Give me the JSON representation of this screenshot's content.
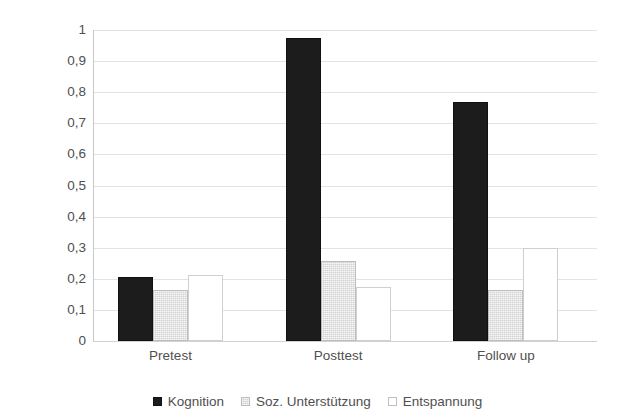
{
  "chart_data": {
    "type": "bar",
    "title": "",
    "subtitle": "",
    "xlabel": "",
    "ylabel": "",
    "categories": [
      "Pretest",
      "Posttest",
      "Follow up"
    ],
    "series": [
      {
        "name": "Kognition",
        "color": "#1c1c1c",
        "values": [
          0.205,
          0.975,
          0.77
        ]
      },
      {
        "name": "Soz. Unterstützung",
        "color": "#d2d2d2",
        "values": [
          0.163,
          0.257,
          0.163
        ]
      },
      {
        "name": "Entspannung",
        "color": "#ffffff",
        "values": [
          0.212,
          0.173,
          0.3
        ]
      }
    ],
    "ylim": [
      0,
      1
    ],
    "ytick_values": [
      0,
      0.1,
      0.2,
      0.3,
      0.4,
      0.5,
      0.6,
      0.7,
      0.8,
      0.9,
      1
    ],
    "ytick_labels": [
      "0",
      "0,1",
      "0,2",
      "0,3",
      "0,4",
      "0,5",
      "0,6",
      "0,7",
      "0,8",
      "0,9",
      "1"
    ],
    "grid": true,
    "grid_axis": "y",
    "legend_position": "bottom",
    "decimal_separator": ","
  },
  "legend": {
    "items": [
      {
        "label": "Kognition"
      },
      {
        "label": "Soz. Unterstützung"
      },
      {
        "label": "Entspannung"
      }
    ]
  }
}
